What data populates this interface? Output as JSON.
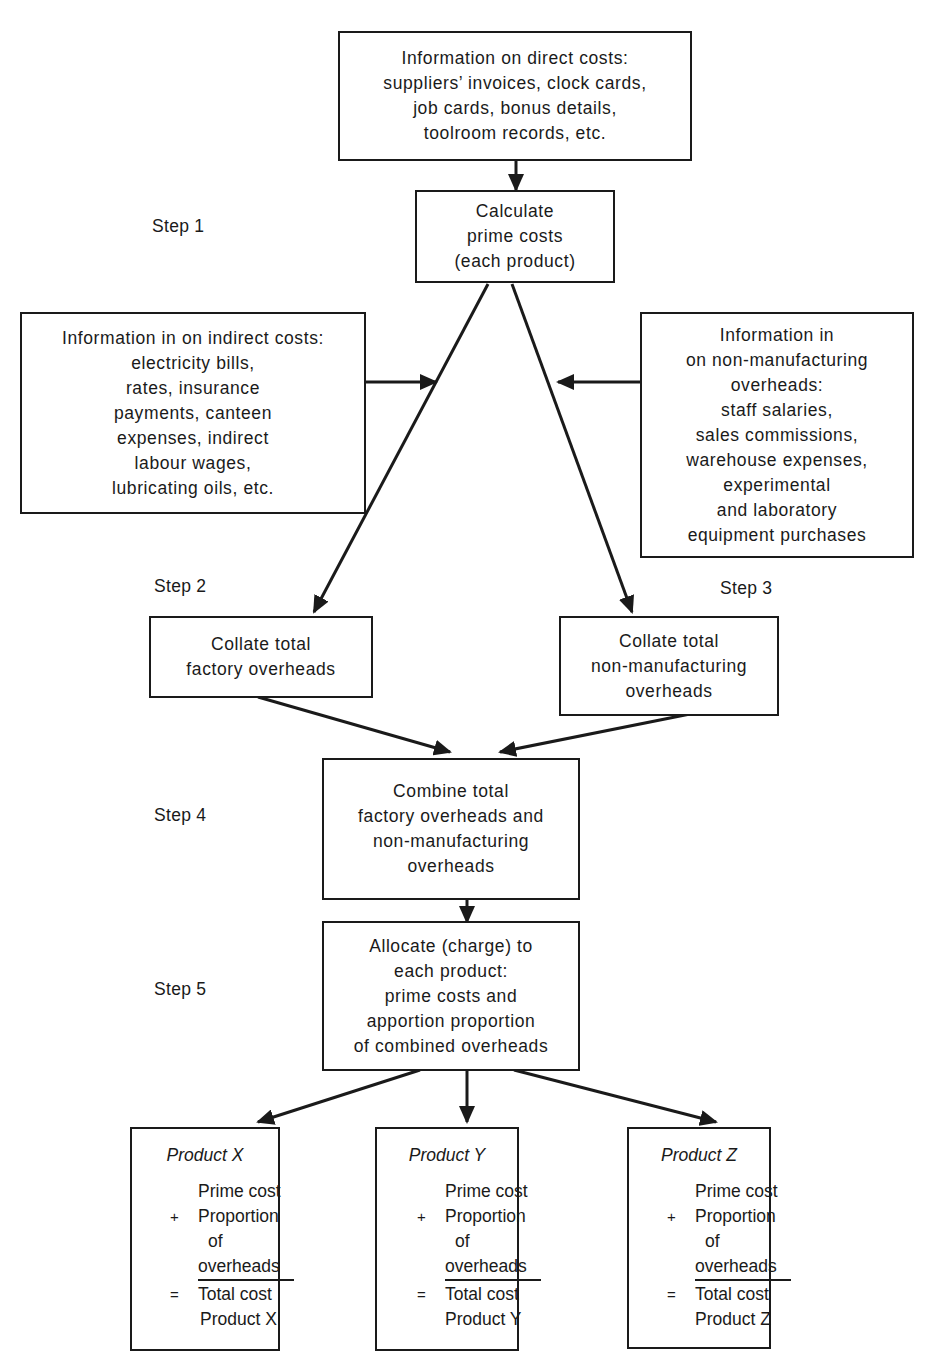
{
  "diagram": {
    "type": "flowchart",
    "steps": [
      {
        "id": "step1",
        "label": "Step 1"
      },
      {
        "id": "step2",
        "label": "Step 2"
      },
      {
        "id": "step3",
        "label": "Step 3"
      },
      {
        "id": "step4",
        "label": "Step 4"
      },
      {
        "id": "step5",
        "label": "Step 5"
      }
    ],
    "nodes": {
      "direct_costs": {
        "lines": [
          "Information on direct costs:",
          "suppliers’ invoices, clock cards,",
          "job cards, bonus details,",
          "toolroom records, etc."
        ]
      },
      "prime_costs": {
        "lines": [
          "Calculate",
          "prime costs",
          "(each product)"
        ]
      },
      "indirect_costs": {
        "lines": [
          "Information in on indirect costs:",
          "electricity bills,",
          "rates, insurance",
          "payments, canteen",
          "expenses, indirect",
          "labour wages,",
          "lubricating oils, etc."
        ]
      },
      "non_manufacturing": {
        "lines": [
          "Information in",
          "on non-manufacturing",
          "overheads:",
          "staff salaries,",
          "sales commissions,",
          "warehouse expenses,",
          "experimental",
          "and laboratory",
          "equipment purchases"
        ]
      },
      "factory_overheads": {
        "lines": [
          "Collate total",
          "factory overheads"
        ]
      },
      "nonmfg_overheads": {
        "lines": [
          "Collate total",
          "non-manufacturing",
          "overheads"
        ]
      },
      "combine": {
        "lines": [
          "Combine total",
          "factory overheads and",
          "non-manufacturing",
          "overheads"
        ]
      },
      "allocate": {
        "lines": [
          "Allocate (charge) to",
          "each product:",
          "prime costs and",
          "apportion proportion",
          "of combined overheads"
        ]
      }
    },
    "products": [
      {
        "title": "Product X",
        "prime": "Prime cost",
        "plus": "+",
        "prop1": "Proportion",
        "prop2": "of",
        "prop3": "overheads",
        "eq": "=",
        "total1": "Total cost",
        "total2": "Product X"
      },
      {
        "title": "Product Y",
        "prime": "Prime cost",
        "plus": "+",
        "prop1": "Proportion",
        "prop2": "of",
        "prop3": "overheads",
        "eq": "=",
        "total1": "Total cost",
        "total2": "Product Y"
      },
      {
        "title": "Product Z",
        "prime": "Prime cost",
        "plus": "+",
        "prop1": "Proportion",
        "prop2": "of",
        "prop3": "overheads",
        "eq": "=",
        "total1": "Total cost",
        "total2": "Product Z"
      }
    ],
    "edges": [
      [
        "direct_costs",
        "prime_costs"
      ],
      [
        "prime_costs",
        "factory_overheads"
      ],
      [
        "prime_costs",
        "nonmfg_overheads"
      ],
      [
        "indirect_costs",
        "prime_costs->factory_overheads"
      ],
      [
        "non_manufacturing",
        "prime_costs->nonmfg_overheads"
      ],
      [
        "factory_overheads",
        "combine"
      ],
      [
        "nonmfg_overheads",
        "combine"
      ],
      [
        "combine",
        "allocate"
      ],
      [
        "allocate",
        "Product X"
      ],
      [
        "allocate",
        "Product Y"
      ],
      [
        "allocate",
        "Product Z"
      ]
    ]
  }
}
